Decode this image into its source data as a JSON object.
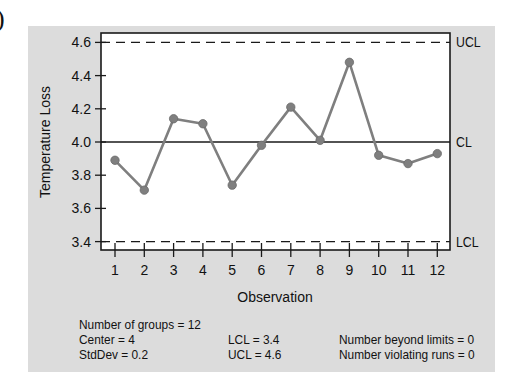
{
  "label_prefix": ")",
  "chart_data": {
    "type": "line",
    "title": "",
    "xlabel": "Observation",
    "ylabel": "Temperature Loss",
    "x": [
      1,
      2,
      3,
      4,
      5,
      6,
      7,
      8,
      9,
      10,
      11,
      12
    ],
    "values": [
      3.89,
      3.71,
      4.14,
      4.11,
      3.74,
      3.98,
      4.21,
      4.01,
      4.48,
      3.92,
      3.87,
      3.93
    ],
    "ylim": [
      3.37,
      4.65
    ],
    "yticks": [
      "3.4",
      "3.6",
      "3.8",
      "4.0",
      "4.2",
      "4.4",
      "4.6"
    ],
    "xticks": [
      "1",
      "2",
      "3",
      "4",
      "5",
      "6",
      "7",
      "8",
      "9",
      "10",
      "11",
      "12"
    ],
    "grid": false,
    "reference_lines": [
      {
        "label": "UCL",
        "value": 4.6,
        "style": "dashed"
      },
      {
        "label": "CL",
        "value": 4.0,
        "style": "solid"
      },
      {
        "label": "LCL",
        "value": 3.4,
        "style": "dashed"
      }
    ],
    "colors": {
      "series": "#7f7f7f",
      "panel": "#dcdcdc",
      "plot_bg": "#ffffff",
      "lines": "#1a1a1a"
    }
  },
  "stats": {
    "groups": "Number of groups = 12",
    "center": "Center = 4",
    "stddev": "StdDev = 0.2",
    "lcl": "LCL = 3.4",
    "ucl": "UCL = 4.6",
    "beyond": "Number beyond limits = 0",
    "violating": "Number violating runs = 0"
  }
}
